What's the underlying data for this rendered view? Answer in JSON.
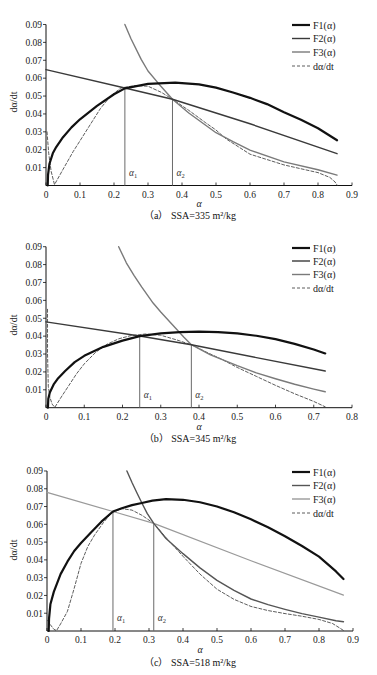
{
  "figure": {
    "panels": [
      {
        "caption": "（a） SSA=335 m²/kg"
      },
      {
        "caption": "（b） SSA=345 m²/kg"
      },
      {
        "caption": "（c） SSA=518 m²/kg"
      }
    ]
  },
  "chart_data": [
    {
      "type": "line",
      "title": "（a） SSA=335 m²/kg",
      "xlabel": "α",
      "ylabel": "dα/dt",
      "xlim": [
        0,
        0.9
      ],
      "ylim": [
        0,
        0.09
      ],
      "grid": false,
      "x_ticks": [
        "0",
        "0.1",
        "0.2",
        "0.3",
        "0.4",
        "0.5",
        "0.6",
        "0.7",
        "0.8",
        "0.9"
      ],
      "y_ticks": [
        "0.01",
        "0.02",
        "0.03",
        "0.04",
        "0.05",
        "0.06",
        "0.07",
        "0.08",
        "0.09"
      ],
      "legend": {
        "position": "upper right",
        "entries": [
          "F1(α)",
          "F2(α)",
          "F3(α)",
          "dα/dt"
        ]
      },
      "markers": [
        {
          "symbol": "α",
          "sub": "1",
          "x": 0.232,
          "y": 0.0545
        },
        {
          "symbol": "α",
          "sub": "2",
          "x": 0.372,
          "y": 0.0482
        }
      ],
      "series": [
        {
          "name": "F1(α)",
          "color": "#111111",
          "width": 2.2,
          "dash": "",
          "points": [
            [
              0.005,
              0
            ],
            [
              0.006,
              0.006
            ],
            [
              0.01,
              0.012
            ],
            [
              0.02,
              0.018
            ],
            [
              0.03,
              0.0215
            ],
            [
              0.05,
              0.027
            ],
            [
              0.075,
              0.0325
            ],
            [
              0.1,
              0.037
            ],
            [
              0.15,
              0.0445
            ],
            [
              0.2,
              0.051
            ],
            [
              0.232,
              0.0543
            ],
            [
              0.3,
              0.0568
            ],
            [
              0.38,
              0.0575
            ],
            [
              0.45,
              0.0565
            ],
            [
              0.5,
              0.0547
            ],
            [
              0.55,
              0.052
            ],
            [
              0.6,
              0.049
            ],
            [
              0.65,
              0.0455
            ],
            [
              0.7,
              0.041
            ],
            [
              0.75,
              0.0368
            ],
            [
              0.8,
              0.032
            ],
            [
              0.856,
              0.0253
            ]
          ]
        },
        {
          "name": "F2(α)",
          "color": "#3a3a3a",
          "width": 1.4,
          "dash": "",
          "points": [
            [
              0,
              0.0648
            ],
            [
              0.232,
              0.0545
            ],
            [
              0.372,
              0.0482
            ],
            [
              0.6,
              0.0345
            ],
            [
              0.856,
              0.0178
            ]
          ]
        },
        {
          "name": "F3(α)",
          "color": "#7a7a7a",
          "width": 1.4,
          "dash": "",
          "points": [
            [
              0.232,
              0.09
            ],
            [
              0.25,
              0.082
            ],
            [
              0.28,
              0.0705
            ],
            [
              0.3,
              0.064
            ],
            [
              0.33,
              0.0572
            ],
            [
              0.372,
              0.0482
            ],
            [
              0.42,
              0.0405
            ],
            [
              0.5,
              0.0295
            ],
            [
              0.55,
              0.0245
            ],
            [
              0.6,
              0.0198
            ],
            [
              0.7,
              0.0132
            ],
            [
              0.8,
              0.0088
            ],
            [
              0.856,
              0.0058
            ]
          ]
        },
        {
          "name": "dα/dt",
          "color": "#333333",
          "width": 0.8,
          "dash": "3 2",
          "points": [
            [
              0.003,
              0.03
            ],
            [
              0.008,
              0.018
            ],
            [
              0.015,
              0.008
            ],
            [
              0.025,
              0.0005
            ],
            [
              0.05,
              0.009
            ],
            [
              0.08,
              0.019
            ],
            [
              0.1,
              0.025
            ],
            [
              0.13,
              0.034
            ],
            [
              0.16,
              0.043
            ],
            [
              0.19,
              0.05
            ],
            [
              0.22,
              0.0545
            ],
            [
              0.26,
              0.0558
            ],
            [
              0.3,
              0.0555
            ],
            [
              0.34,
              0.052
            ],
            [
              0.372,
              0.0482
            ],
            [
              0.42,
              0.042
            ],
            [
              0.47,
              0.035
            ],
            [
              0.5,
              0.031
            ],
            [
              0.53,
              0.026
            ],
            [
              0.6,
              0.0175
            ],
            [
              0.7,
              0.0115
            ],
            [
              0.8,
              0.0072
            ],
            [
              0.835,
              0.0045
            ],
            [
              0.85,
              0.002
            ],
            [
              0.857,
              0.0
            ]
          ]
        }
      ]
    },
    {
      "type": "line",
      "title": "（b） SSA=345 m²/kg",
      "xlabel": "α",
      "ylabel": "dα/dt",
      "xlim": [
        0,
        0.8
      ],
      "ylim": [
        0,
        0.09
      ],
      "grid": false,
      "x_ticks": [
        "0",
        "0.1",
        "0.2",
        "0.3",
        "0.4",
        "0.5",
        "0.6",
        "0.7",
        "0.8"
      ],
      "y_ticks": [
        "0.01",
        "0.02",
        "0.03",
        "0.04",
        "0.05",
        "0.06",
        "0.07",
        "0.08",
        "0.09"
      ],
      "legend": {
        "position": "upper right",
        "entries": [
          "F1(α)",
          "F2(α)",
          "F3(α)",
          "dα/dt"
        ]
      },
      "markers": [
        {
          "symbol": "α",
          "sub": "1",
          "x": 0.245,
          "y": 0.0401
        },
        {
          "symbol": "α",
          "sub": "2",
          "x": 0.38,
          "y": 0.0352
        }
      ],
      "series": [
        {
          "name": "F1(α)",
          "color": "#111111",
          "width": 2.2,
          "dash": "",
          "points": [
            [
              0.005,
              0
            ],
            [
              0.006,
              0.005
            ],
            [
              0.01,
              0.0085
            ],
            [
              0.02,
              0.013
            ],
            [
              0.03,
              0.016
            ],
            [
              0.05,
              0.0205
            ],
            [
              0.075,
              0.0255
            ],
            [
              0.1,
              0.029
            ],
            [
              0.15,
              0.034
            ],
            [
              0.2,
              0.0375
            ],
            [
              0.245,
              0.04
            ],
            [
              0.3,
              0.0415
            ],
            [
              0.35,
              0.0423
            ],
            [
              0.4,
              0.0425
            ],
            [
              0.45,
              0.0423
            ],
            [
              0.5,
              0.0415
            ],
            [
              0.55,
              0.0402
            ],
            [
              0.6,
              0.0383
            ],
            [
              0.65,
              0.0357
            ],
            [
              0.7,
              0.0325
            ],
            [
              0.73,
              0.0303
            ]
          ]
        },
        {
          "name": "F2(α)",
          "color": "#3a3a3a",
          "width": 1.4,
          "dash": "",
          "points": [
            [
              0,
              0.048
            ],
            [
              0.245,
              0.0401
            ],
            [
              0.38,
              0.0352
            ],
            [
              0.55,
              0.028
            ],
            [
              0.73,
              0.0205
            ]
          ]
        },
        {
          "name": "F3(α)",
          "color": "#7a7a7a",
          "width": 1.4,
          "dash": "",
          "points": [
            [
              0.19,
              0.09
            ],
            [
              0.21,
              0.081
            ],
            [
              0.23,
              0.074
            ],
            [
              0.25,
              0.0675
            ],
            [
              0.28,
              0.0585
            ],
            [
              0.3,
              0.0535
            ],
            [
              0.33,
              0.0465
            ],
            [
              0.36,
              0.0395
            ],
            [
              0.38,
              0.0352
            ],
            [
              0.43,
              0.0295
            ],
            [
              0.5,
              0.0235
            ],
            [
              0.55,
              0.0195
            ],
            [
              0.6,
              0.0162
            ],
            [
              0.65,
              0.0131
            ],
            [
              0.7,
              0.0104
            ],
            [
              0.73,
              0.0089
            ]
          ]
        },
        {
          "name": "dα/dt",
          "color": "#333333",
          "width": 0.8,
          "dash": "3 2",
          "points": [
            [
              0.004,
              0.055
            ],
            [
              0.004,
              0.03
            ],
            [
              0.006,
              0.012
            ],
            [
              0.01,
              0.006
            ],
            [
              0.016,
              0.002
            ],
            [
              0.023,
              0.0002
            ],
            [
              0.04,
              0.006
            ],
            [
              0.06,
              0.0125
            ],
            [
              0.08,
              0.019
            ],
            [
              0.1,
              0.0245
            ],
            [
              0.13,
              0.031
            ],
            [
              0.16,
              0.0355
            ],
            [
              0.19,
              0.0385
            ],
            [
              0.22,
              0.0402
            ],
            [
              0.26,
              0.0412
            ],
            [
              0.3,
              0.0405
            ],
            [
              0.34,
              0.038
            ],
            [
              0.38,
              0.0352
            ],
            [
              0.42,
              0.031
            ],
            [
              0.46,
              0.027
            ],
            [
              0.5,
              0.0225
            ],
            [
              0.55,
              0.0175
            ],
            [
              0.6,
              0.0125
            ],
            [
              0.65,
              0.0078
            ],
            [
              0.7,
              0.0035
            ],
            [
              0.73,
              0.0005
            ]
          ]
        }
      ]
    },
    {
      "type": "line",
      "title": "（c） SSA=518 m²/kg",
      "xlabel": "α",
      "ylabel": "dα/dt",
      "xlim": [
        0,
        0.9
      ],
      "ylim": [
        0,
        0.09
      ],
      "grid": false,
      "x_ticks": [
        "0",
        "0.1",
        "0.2",
        "0.3",
        "0.4",
        "0.5",
        "0.6",
        "0.7",
        "0.8",
        "0.9"
      ],
      "y_ticks": [
        "0.01",
        "0.02",
        "0.03",
        "0.04",
        "0.05",
        "0.06",
        "0.07",
        "0.08",
        "0.09"
      ],
      "legend": {
        "position": "upper right",
        "entries": [
          "F1(α)",
          "F2(α)",
          "F3(α)",
          "dα/dt"
        ]
      },
      "markers": [
        {
          "symbol": "α",
          "sub": "1",
          "x": 0.194,
          "y": 0.0672
        },
        {
          "symbol": "α",
          "sub": "2",
          "x": 0.314,
          "y": 0.0605
        }
      ],
      "series": [
        {
          "name": "F1(α)",
          "color": "#111111",
          "width": 2.2,
          "dash": "",
          "points": [
            [
              0.005,
              0
            ],
            [
              0.006,
              0.007
            ],
            [
              0.01,
              0.015
            ],
            [
              0.02,
              0.022
            ],
            [
              0.04,
              0.032
            ],
            [
              0.06,
              0.039
            ],
            [
              0.08,
              0.045
            ],
            [
              0.1,
              0.0495
            ],
            [
              0.13,
              0.0555
            ],
            [
              0.16,
              0.0615
            ],
            [
              0.194,
              0.0672
            ],
            [
              0.22,
              0.069
            ],
            [
              0.25,
              0.0708
            ],
            [
              0.279,
              0.072
            ],
            [
              0.31,
              0.0733
            ],
            [
              0.35,
              0.0742
            ],
            [
              0.4,
              0.0738
            ],
            [
              0.45,
              0.0724
            ],
            [
              0.5,
              0.07
            ],
            [
              0.55,
              0.0668
            ],
            [
              0.6,
              0.0628
            ],
            [
              0.65,
              0.0583
            ],
            [
              0.7,
              0.0533
            ],
            [
              0.75,
              0.0478
            ],
            [
              0.8,
              0.0418
            ],
            [
              0.85,
              0.0335
            ],
            [
              0.872,
              0.0292
            ]
          ]
        },
        {
          "name": "F2(α)",
          "color": "#555555",
          "width": 1.4,
          "dash": "",
          "points": [
            [
              0.235,
              0.09
            ],
            [
              0.25,
              0.0835
            ],
            [
              0.265,
              0.0775
            ],
            [
              0.279,
              0.072
            ],
            [
              0.295,
              0.066
            ],
            [
              0.314,
              0.0605
            ],
            [
              0.35,
              0.052
            ],
            [
              0.4,
              0.0435
            ],
            [
              0.45,
              0.0355
            ],
            [
              0.5,
              0.0285
            ],
            [
              0.55,
              0.0228
            ],
            [
              0.6,
              0.018
            ],
            [
              0.65,
              0.0148
            ],
            [
              0.7,
              0.0122
            ],
            [
              0.75,
              0.0098
            ],
            [
              0.8,
              0.0078
            ],
            [
              0.85,
              0.0058
            ],
            [
              0.872,
              0.0052
            ]
          ]
        },
        {
          "name": "F3(α)",
          "color": "#9a9a9a",
          "width": 1.2,
          "dash": "",
          "points": [
            [
              0,
              0.078
            ],
            [
              0.194,
              0.0672
            ],
            [
              0.314,
              0.0605
            ],
            [
              0.6,
              0.0395
            ],
            [
              0.872,
              0.0202
            ]
          ]
        },
        {
          "name": "dα/dt",
          "color": "#333333",
          "width": 0.8,
          "dash": "3 2",
          "points": [
            [
              0.002,
              0.006
            ],
            [
              0.01,
              0.0035
            ],
            [
              0.02,
              0.001
            ],
            [
              0.028,
              0.0002
            ],
            [
              0.04,
              0.004
            ],
            [
              0.06,
              0.011
            ],
            [
              0.08,
              0.024
            ],
            [
              0.1,
              0.038
            ],
            [
              0.12,
              0.0475
            ],
            [
              0.14,
              0.054
            ],
            [
              0.166,
              0.061
            ],
            [
              0.19,
              0.0665
            ],
            [
              0.22,
              0.0688
            ],
            [
              0.25,
              0.068
            ],
            [
              0.28,
              0.065
            ],
            [
              0.314,
              0.0605
            ],
            [
              0.35,
              0.0525
            ],
            [
              0.4,
              0.042
            ],
            [
              0.45,
              0.032
            ],
            [
              0.5,
              0.0235
            ],
            [
              0.55,
              0.0178
            ],
            [
              0.6,
              0.0138
            ],
            [
              0.65,
              0.0115
            ],
            [
              0.7,
              0.0098
            ],
            [
              0.75,
              0.0083
            ],
            [
              0.8,
              0.0065
            ],
            [
              0.84,
              0.0042
            ],
            [
              0.86,
              0.0018
            ],
            [
              0.872,
              0.0003
            ]
          ]
        }
      ]
    }
  ]
}
